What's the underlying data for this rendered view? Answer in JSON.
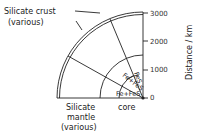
{
  "labels": {
    "crust_line1": "Silicate crust",
    "crust_line2": "(various)",
    "mantle_line1": "Silicate",
    "mantle_line2": "mantle",
    "mantle_line3": "(various)",
    "core": "core",
    "fes": "FeS",
    "fe_fes_upper": "Fe+FeS",
    "fe_fes_lower": "Fe+FeS"
  },
  "axis": {
    "title": "Distance / km",
    "ticks": [
      "0",
      "1000",
      "2000",
      "3000"
    ]
  }
}
